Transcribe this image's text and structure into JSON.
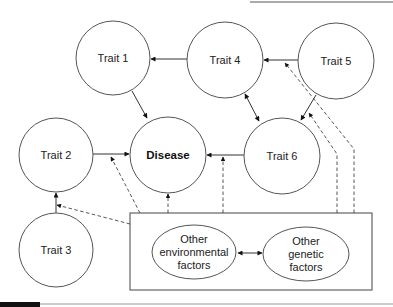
{
  "diagram": {
    "type": "causal-network",
    "nodes": [
      {
        "id": "trait1",
        "label": "Trait 1"
      },
      {
        "id": "trait2",
        "label": "Trait 2"
      },
      {
        "id": "trait3",
        "label": "Trait 3"
      },
      {
        "id": "trait4",
        "label": "Trait 4"
      },
      {
        "id": "trait5",
        "label": "Trait 5"
      },
      {
        "id": "trait6",
        "label": "Trait 6"
      },
      {
        "id": "disease",
        "label": "Disease"
      }
    ],
    "factors_box": {
      "env": {
        "line1": "Other",
        "line2": "environmental",
        "line3": "factors"
      },
      "gen": {
        "line1": "Other",
        "line2": "genetic",
        "line3": "factors"
      }
    },
    "edges_solid": [
      {
        "from": "trait5",
        "to": "trait4"
      },
      {
        "from": "trait4",
        "to": "trait1"
      },
      {
        "from": "trait1",
        "to": "disease"
      },
      {
        "from": "trait2",
        "to": "disease"
      },
      {
        "from": "trait6",
        "to": "disease"
      },
      {
        "from": "trait4",
        "to": "trait6",
        "bidirectional": true
      },
      {
        "from": "trait5",
        "to": "trait6"
      },
      {
        "from": "trait3",
        "to": "trait2"
      },
      {
        "from": "env",
        "to": "gen",
        "bidirectional": true
      }
    ],
    "edges_dashed": [
      {
        "from": "factors_box",
        "to": "trait2"
      },
      {
        "from": "factors_box",
        "to": "trait2-disease-edge"
      },
      {
        "from": "factors_box",
        "to": "disease"
      },
      {
        "from": "factors_box",
        "to": "trait6-disease-edge"
      },
      {
        "from": "factors_box",
        "to": "trait5-trait6-edge"
      },
      {
        "from": "factors_box",
        "to": "trait5-trait4-edge"
      }
    ]
  }
}
